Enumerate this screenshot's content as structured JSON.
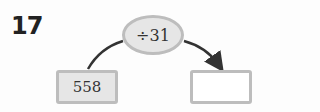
{
  "problem": {
    "number": "17",
    "operation": "÷31",
    "input_value": "558",
    "output_value": ""
  }
}
